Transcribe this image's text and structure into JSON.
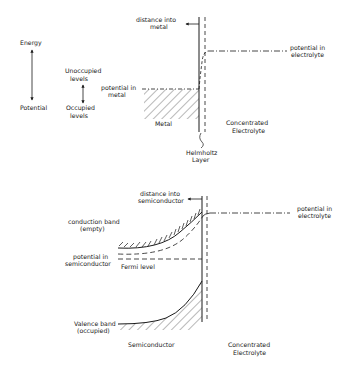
{
  "legend": {
    "energy": "Energy",
    "potential": "Potential",
    "unoccupied": [
      "Unoccupied",
      "levels"
    ],
    "occupied": [
      "Occupied",
      "levels"
    ]
  },
  "metal_diagram": {
    "distance_label": [
      "distance into",
      "metal"
    ],
    "potential_metal": [
      "potential in",
      "metal"
    ],
    "potential_electrolyte": [
      "potential in",
      "electrolyte"
    ],
    "metal_label": "Metal",
    "electrolyte_label": [
      "Concentrated",
      "Electrolyte"
    ],
    "helmholtz_label": [
      "Helmholtz",
      "Layer"
    ]
  },
  "semiconductor_diagram": {
    "distance_label": [
      "distance into",
      "semiconductor"
    ],
    "conduction_band": [
      "conduction band",
      "(empty)"
    ],
    "potential_semiconductor": [
      "potential in",
      "semiconductor"
    ],
    "fermi_level": "Fermi level",
    "potential_electrolyte": [
      "potential in",
      "electrolyte"
    ],
    "valence_band": [
      "Valence band",
      "(occupied)"
    ],
    "semiconductor_label": "Semiconductor",
    "electrolyte_label": [
      "Concentrated",
      "Electrolyte"
    ]
  },
  "colors": {
    "ink": "#1a1a1a",
    "background": "#ffffff"
  }
}
